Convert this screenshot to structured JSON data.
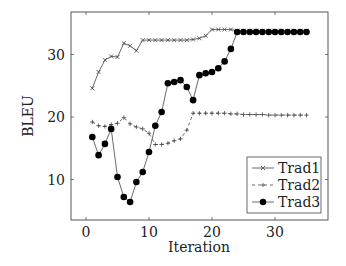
{
  "chart_data": {
    "type": "line",
    "title": "",
    "xlabel": "Iteration",
    "ylabel": "BLEU",
    "xlim": [
      -2.5,
      38.5
    ],
    "ylim": [
      3.0,
      36.3
    ],
    "xticks": [
      0,
      10,
      20,
      30
    ],
    "yticks": [
      10,
      20,
      30
    ],
    "xtick_labels": [
      "0",
      "10",
      "20",
      "30"
    ],
    "ytick_labels": [
      "10",
      "20",
      "30"
    ],
    "grid": false,
    "legend_position": "lower right",
    "x": [
      1,
      2,
      3,
      4,
      5,
      6,
      7,
      8,
      9,
      10,
      11,
      12,
      13,
      14,
      15,
      16,
      17,
      18,
      19,
      20,
      21,
      22,
      23,
      24,
      25,
      26,
      27,
      28,
      29,
      30,
      31,
      32,
      33,
      34,
      35
    ],
    "series": [
      {
        "name": "Trad1",
        "marker": "x",
        "line_style": "solid",
        "values": [
          24.6,
          27.2,
          29.1,
          29.7,
          29.6,
          31.8,
          31.4,
          30.6,
          32.3,
          32.3,
          32.3,
          32.3,
          32.3,
          32.3,
          32.3,
          32.3,
          32.4,
          32.6,
          33.0,
          34.0,
          34.0,
          34.0,
          34.0,
          33.8,
          33.8,
          33.8,
          33.8,
          33.8,
          33.8,
          33.8,
          33.8,
          33.8,
          33.8,
          33.8,
          33.8
        ]
      },
      {
        "name": "Trad2",
        "marker": "+",
        "line_style": "dashed",
        "values": [
          19.2,
          18.6,
          18.5,
          18.8,
          19.0,
          19.9,
          18.9,
          18.4,
          18.1,
          17.4,
          15.6,
          15.6,
          15.8,
          16.2,
          16.5,
          17.9,
          20.6,
          20.6,
          20.6,
          20.6,
          20.6,
          20.6,
          20.5,
          20.5,
          20.4,
          20.4,
          20.4,
          20.4,
          20.3,
          20.3,
          20.3,
          20.3,
          20.3,
          20.3,
          20.3
        ]
      },
      {
        "name": "Trad3",
        "marker": "filled-circle",
        "line_style": "solid",
        "values": [
          16.8,
          13.9,
          15.7,
          18.1,
          10.4,
          7.2,
          6.4,
          9.6,
          11.2,
          14.4,
          18.6,
          20.8,
          25.4,
          25.6,
          25.9,
          24.8,
          22.7,
          26.7,
          27.0,
          27.2,
          27.8,
          28.9,
          30.9,
          33.6,
          33.6,
          33.6,
          33.6,
          33.6,
          33.6,
          33.6,
          33.6,
          33.6,
          33.6,
          33.6,
          33.6
        ]
      }
    ]
  },
  "legend": {
    "items": [
      {
        "label": "Trad1"
      },
      {
        "label": "Trad2"
      },
      {
        "label": "Trad3"
      }
    ]
  },
  "axes": {
    "xlabel": "Iteration",
    "ylabel": "BLEU"
  }
}
